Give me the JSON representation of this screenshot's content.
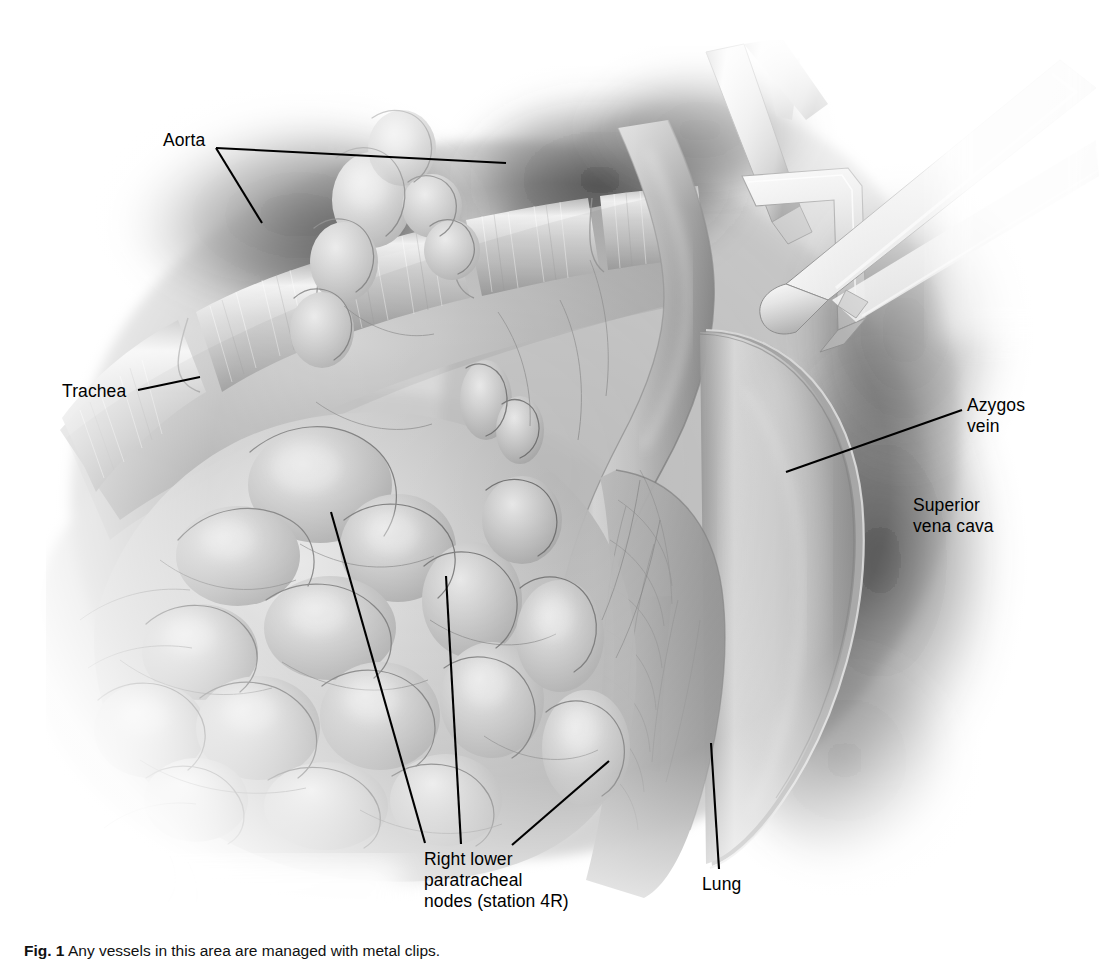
{
  "figure": {
    "kind": "medical-illustration",
    "background_color": "#ffffff",
    "ink_color": "#000000",
    "tissue_tone": "#9a9a9a"
  },
  "labels": {
    "aorta": "Aorta",
    "trachea": "Trachea",
    "azygos_vein": "Azygos\nvein",
    "superior_vena_cava": "Superior\nvena cava",
    "nodes": "Right lower\nparatracheal\nnodes (station 4R)",
    "lung": "Lung"
  },
  "caption": {
    "number": "Fig. 1",
    "text": "Any vessels in this area are managed with metal clips."
  },
  "structures": [
    {
      "name": "aorta",
      "description": "Aortic arch shadow behind trachea, dark vignette region upper left"
    },
    {
      "name": "trachea",
      "description": "Tracheal cartilage rings running upper-right to lower-left"
    },
    {
      "name": "azygos-vein",
      "description": "Large tubular vein arching over right main bronchus"
    },
    {
      "name": "superior-vena-cava",
      "description": "Vessel retracted laterally on the right"
    },
    {
      "name": "paratracheal-nodes",
      "description": "Lobulated lymph node packet filling the lower central field"
    },
    {
      "name": "lung",
      "description": "Retracted lung parenchyma, lower right"
    },
    {
      "name": "retractor-upper",
      "description": "Malleable surgical retractor blade entering from upper right"
    },
    {
      "name": "retractor-lower",
      "description": "Second retractor blade entering from right"
    }
  ]
}
